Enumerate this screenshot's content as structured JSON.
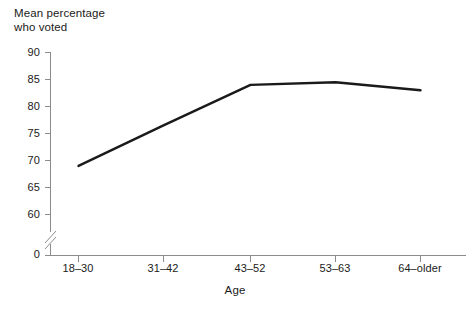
{
  "chart_data": {
    "type": "line",
    "title": "",
    "ylabel": "Mean percentage\nwho voted",
    "ylabel_lines": [
      "Mean percentage",
      "who voted"
    ],
    "xlabel": "Age",
    "categories": [
      "18–30",
      "31–42",
      "43–52",
      "53–63",
      "64–older"
    ],
    "values": [
      69,
      76.5,
      84,
      84.5,
      83
    ],
    "series": [
      {
        "name": "Mean percentage who voted",
        "values": [
          69,
          76.5,
          84,
          84.5,
          83
        ]
      }
    ],
    "yticks": [
      90,
      85,
      80,
      75,
      70,
      65,
      60,
      0
    ],
    "ylim": [
      60,
      90
    ],
    "y_axis_break": true,
    "y_axis_break_label": "0",
    "grid": false,
    "legend": "none",
    "line_color": "#1a1a1a",
    "axis_color": "#8c8c8c"
  },
  "axes": {
    "y_title_line1": "Mean percentage",
    "y_title_line2": "who voted",
    "x_title": "Age"
  },
  "ytick_labels": [
    "90",
    "85",
    "80",
    "75",
    "70",
    "65",
    "60",
    "0"
  ],
  "xtick_labels": [
    "18–30",
    "31–42",
    "43–52",
    "53–63",
    "64–older"
  ]
}
